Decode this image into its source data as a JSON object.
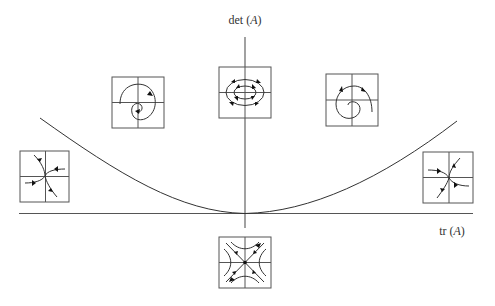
{
  "diagram": {
    "axes": {
      "y_label": {
        "prefix": "det ",
        "open": "(",
        "var": "A",
        "close": ")"
      },
      "x_label": {
        "prefix": "tr ",
        "open": "(",
        "var": "A",
        "close": ")"
      }
    },
    "curve": {
      "description": "parabola det = tr^2 / 4",
      "vertex": "origin"
    },
    "phase_portraits": [
      {
        "id": "spiral-sink",
        "region": "upper-left, above parabola",
        "type": "spiral sink"
      },
      {
        "id": "center",
        "region": "positive det axis",
        "type": "center"
      },
      {
        "id": "spiral-source",
        "region": "upper-right, above parabola",
        "type": "spiral source"
      },
      {
        "id": "node-sink",
        "region": "left, below parabola",
        "type": "sink (node)"
      },
      {
        "id": "node-source",
        "region": "right, below parabola",
        "type": "source (node)"
      },
      {
        "id": "saddle",
        "region": "below tr axis",
        "type": "saddle"
      }
    ],
    "colors": {
      "line": "#333333",
      "axis": "#555555",
      "background": "#ffffff"
    }
  }
}
